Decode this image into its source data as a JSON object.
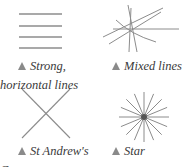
{
  "panels": [
    {
      "id": "strong-horizontal",
      "caption_line1": "Strong,",
      "caption_line2": "horizontal lines",
      "marker": "triangle-icon"
    },
    {
      "id": "mixed-lines",
      "caption_line1": "Mixed lines",
      "marker": "triangle-icon"
    },
    {
      "id": "st-andrews-cross",
      "caption_line1": "St Andrew's",
      "caption_line2": "Cross",
      "marker": "triangle-icon"
    },
    {
      "id": "star",
      "caption_line1": "Star",
      "marker": "triangle-icon"
    }
  ],
  "colors": {
    "line": "#8c8c8c",
    "text": "#3a3a3a",
    "marker": "#8a8a8a",
    "center": "#555555"
  }
}
